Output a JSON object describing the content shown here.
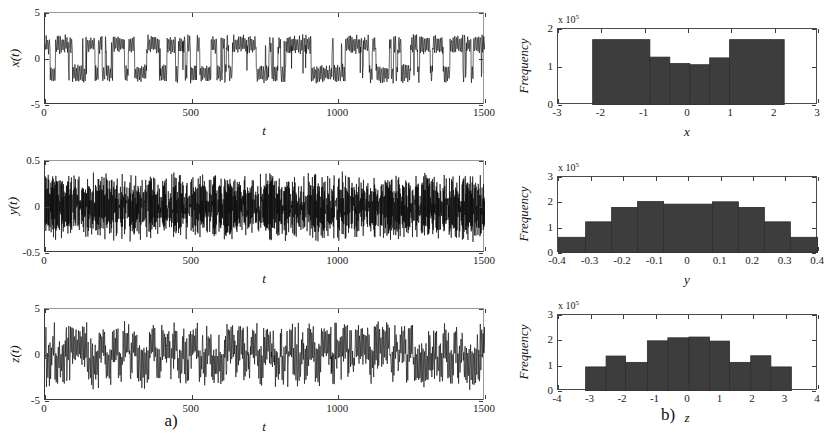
{
  "figure": {
    "background": "#ffffff",
    "series_color": "#000000",
    "hist_fill": "#3d3d3d",
    "hist_edge": "#2d2d2d",
    "axis_color": "#3c3c3c"
  },
  "captions": {
    "left": "a)",
    "right": "b)"
  },
  "chart_data": [
    {
      "type": "line",
      "name": "x-time-series",
      "title": "",
      "xlabel": "t",
      "ylabel": "x(t)",
      "xlim": [
        0,
        1500
      ],
      "ylim": [
        -5,
        5
      ],
      "xticks": [
        0,
        500,
        1000,
        1500
      ],
      "xticklabels": [
        "0",
        "500",
        "1000",
        "1500"
      ],
      "yticks": [
        -5,
        0,
        5
      ],
      "yticklabels": [
        "-5",
        "0",
        "5"
      ],
      "grid": false,
      "description": "Chaotic double-scroll oscillation switching between two lobes centred near +1.6 and -1.6, envelope roughly -2.6 to 2.6",
      "signal": {
        "mode": "chaotic-bistable",
        "samples": 1500,
        "lobe_centers": [
          1.6,
          -1.6
        ],
        "lobe_amplitude": 0.95,
        "carrier_frequency": 1.15,
        "switch_rate": 0.055,
        "seed": 20341
      }
    },
    {
      "type": "line",
      "name": "y-time-series",
      "title": "",
      "xlabel": "t",
      "ylabel": "y(t)",
      "xlim": [
        0,
        1500
      ],
      "ylim": [
        -0.5,
        0.5
      ],
      "xticks": [
        0,
        500,
        1000,
        1500
      ],
      "xticklabels": [
        "0",
        "500",
        "1000",
        "1500"
      ],
      "yticks": [
        -0.5,
        0,
        0.5
      ],
      "yticklabels": [
        "-0.5",
        "0",
        "0.5"
      ],
      "grid": false,
      "description": "Dense noisy oscillation filling the band roughly -0.38 to 0.38, symmetric about zero",
      "signal": {
        "mode": "dense-oscillation",
        "samples": 1500,
        "lobe_centers": [
          0.0
        ],
        "lobe_amplitude": 0.33,
        "carrier_frequency": 3.4,
        "switch_rate": 0.0,
        "seed": 7712
      }
    },
    {
      "type": "line",
      "name": "z-time-series",
      "title": "",
      "xlabel": "t",
      "ylabel": "z(t)",
      "xlim": [
        0,
        1500
      ],
      "ylim": [
        -5,
        5
      ],
      "xticks": [
        0,
        500,
        1000,
        1500
      ],
      "xticklabels": [
        "0",
        "500",
        "1000",
        "1500"
      ],
      "yticks": [
        -5,
        0,
        5
      ],
      "yticklabels": [
        "-5",
        "0",
        "5"
      ],
      "grid": false,
      "description": "Chaotic spiking signal with bursts reaching about +3 and dips to about -3.2",
      "signal": {
        "mode": "chaotic-spiking",
        "samples": 1500,
        "lobe_centers": [
          1.3,
          -1.3
        ],
        "lobe_amplitude": 1.7,
        "carrier_frequency": 1.35,
        "switch_rate": 0.075,
        "seed": 4457
      }
    },
    {
      "type": "bar",
      "name": "x-histogram",
      "title": "",
      "xlabel": "x",
      "ylabel": "Frequency",
      "y_exponent_label": "x 10",
      "y_exponent": "5",
      "xlim": [
        -3,
        3
      ],
      "ylim": [
        0,
        2
      ],
      "xticks": [
        -3,
        -2,
        -1,
        0,
        1,
        2,
        3
      ],
      "xticklabels": [
        "-3",
        "-2",
        "-1",
        "0",
        "1",
        "2",
        "3"
      ],
      "yticks": [
        0,
        1,
        2
      ],
      "yticklabels": [
        "0",
        "1",
        "2"
      ],
      "grid": false,
      "bin_edges": [
        -2.2,
        -1.65,
        -1.1,
        -0.85,
        -0.4,
        0.0,
        0.5,
        0.95,
        1.45,
        2.2
      ],
      "bars": [
        {
          "left": -2.2,
          "right": -0.88,
          "value": 1.72
        },
        {
          "left": -0.88,
          "right": -0.42,
          "value": 1.26
        },
        {
          "left": -0.42,
          "right": 0.04,
          "value": 1.09
        },
        {
          "left": 0.04,
          "right": 0.5,
          "value": 1.06
        },
        {
          "left": 0.5,
          "right": 0.96,
          "value": 1.24
        },
        {
          "left": 0.96,
          "right": 2.22,
          "value": 1.72
        }
      ],
      "values": [
        1.72,
        1.26,
        1.09,
        1.06,
        1.24,
        1.72
      ]
    },
    {
      "type": "bar",
      "name": "y-histogram",
      "title": "",
      "xlabel": "y",
      "ylabel": "Frequency",
      "y_exponent_label": "x 10",
      "y_exponent": "5",
      "xlim": [
        -0.4,
        0.4
      ],
      "ylim": [
        0,
        3
      ],
      "xticks": [
        -0.4,
        -0.3,
        -0.2,
        -0.1,
        0,
        0.1,
        0.2,
        0.3,
        0.4
      ],
      "xticklabels": [
        "-0.4",
        "-0.3",
        "-0.2",
        "-0.1",
        "0",
        "0.1",
        "0.2",
        "0.3",
        "0.4"
      ],
      "yticks": [
        0,
        1,
        2,
        3
      ],
      "yticklabels": [
        "0",
        "1",
        "2",
        "3"
      ],
      "grid": false,
      "bars": [
        {
          "left": -0.4,
          "right": -0.315,
          "value": 0.62
        },
        {
          "left": -0.315,
          "right": -0.235,
          "value": 1.23
        },
        {
          "left": -0.235,
          "right": -0.155,
          "value": 1.8
        },
        {
          "left": -0.155,
          "right": -0.075,
          "value": 2.03
        },
        {
          "left": -0.075,
          "right": 0.075,
          "value": 1.93
        },
        {
          "left": 0.075,
          "right": 0.155,
          "value": 2.02
        },
        {
          "left": 0.155,
          "right": 0.235,
          "value": 1.8
        },
        {
          "left": 0.235,
          "right": 0.315,
          "value": 1.23
        },
        {
          "left": 0.315,
          "right": 0.4,
          "value": 0.62
        }
      ],
      "values": [
        0.62,
        1.23,
        1.8,
        2.03,
        1.93,
        2.02,
        1.8,
        1.23,
        0.62
      ]
    },
    {
      "type": "bar",
      "name": "z-histogram",
      "title": "",
      "xlabel": "z",
      "ylabel": "Frequency",
      "y_exponent_label": "x 10",
      "y_exponent": "5",
      "xlim": [
        -4,
        4
      ],
      "ylim": [
        0,
        3
      ],
      "xticks": [
        -4,
        -3,
        -2,
        -1,
        0,
        1,
        2,
        3,
        4
      ],
      "xticklabels": [
        "-4",
        "-3",
        "-2",
        "-1",
        "0",
        "1",
        "2",
        "3",
        "4"
      ],
      "yticks": [
        0,
        1,
        2,
        3
      ],
      "yticklabels": [
        "0",
        "1",
        "2",
        "3"
      ],
      "grid": false,
      "bars": [
        {
          "left": -3.15,
          "right": -2.52,
          "value": 0.95
        },
        {
          "left": -2.52,
          "right": -1.92,
          "value": 1.38
        },
        {
          "left": -1.92,
          "right": -1.25,
          "value": 1.13
        },
        {
          "left": -1.25,
          "right": -0.62,
          "value": 1.98
        },
        {
          "left": -0.62,
          "right": 0.03,
          "value": 2.1
        },
        {
          "left": 0.03,
          "right": 0.66,
          "value": 2.13
        },
        {
          "left": 0.66,
          "right": 1.28,
          "value": 1.97
        },
        {
          "left": 1.28,
          "right": 1.93,
          "value": 1.13
        },
        {
          "left": 1.93,
          "right": 2.55,
          "value": 1.39
        },
        {
          "left": 2.55,
          "right": 3.18,
          "value": 0.95
        }
      ],
      "values": [
        0.95,
        1.38,
        1.13,
        1.98,
        2.1,
        2.13,
        1.97,
        1.13,
        1.39,
        0.95
      ]
    }
  ]
}
